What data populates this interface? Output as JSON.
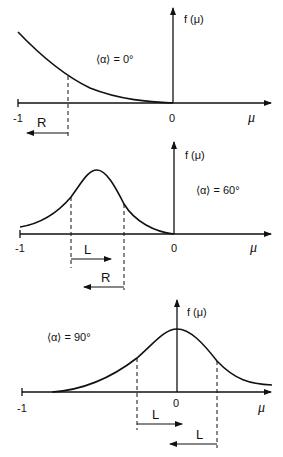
{
  "figure": {
    "panels": [
      {
        "id": "panel-0deg",
        "condition": "⟨α⟩ = 0°",
        "y_axis_label": "f(μ)",
        "x_axis_label": "μ",
        "x_ticks": [
          "-1",
          "0"
        ],
        "arrows": [
          {
            "label": "R",
            "direction": "left"
          }
        ],
        "curve_shape": "monotonic decay from μ=-1 to μ=0"
      },
      {
        "id": "panel-60deg",
        "condition": "⟨α⟩ = 60°",
        "y_axis_label": "f(μ)",
        "x_axis_label": "μ",
        "x_ticks": [
          "-1",
          "0"
        ],
        "arrows": [
          {
            "label": "L",
            "direction": "right"
          },
          {
            "label": "R",
            "direction": "left"
          }
        ],
        "curve_shape": "bell peak near μ=-0.5"
      },
      {
        "id": "panel-90deg",
        "condition": "⟨α⟩ = 90°",
        "y_axis_label": "f(μ)",
        "x_axis_label": "μ",
        "x_ticks": [
          "-1",
          "0"
        ],
        "arrows": [
          {
            "label": "L",
            "direction": "right"
          },
          {
            "label": "L",
            "direction": "left"
          }
        ],
        "curve_shape": "bell peak centered at μ=0"
      }
    ]
  },
  "labels": {
    "p1_cond": "⟨α⟩ = 0°",
    "p2_cond": "⟨α⟩ = 60°",
    "p3_cond": "⟨α⟩ = 90°",
    "fmu": "f (μ)",
    "mu": "μ",
    "minus_one": "-1",
    "zero": "0",
    "R": "R",
    "L": "L"
  }
}
